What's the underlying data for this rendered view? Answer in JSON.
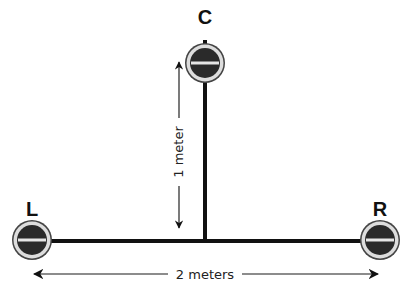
{
  "diagram": {
    "microphones": [
      {
        "id": "L",
        "label": "L"
      },
      {
        "id": "C",
        "label": "C"
      },
      {
        "id": "R",
        "label": "R"
      }
    ],
    "dimensions": {
      "vertical_label": "1 meter",
      "horizontal_label": "2 meters"
    },
    "colors": {
      "line": "#111111",
      "mic_body": "#2a2a2a",
      "mic_ring": "#c8c8c8",
      "arrow": "#555555"
    }
  }
}
